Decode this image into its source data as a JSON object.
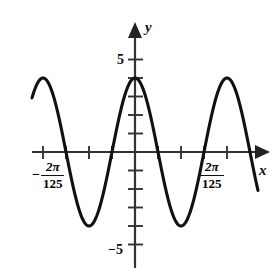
{
  "figure": {
    "name": "cosine-graph",
    "background_color": "#ffffff",
    "curve_color": "#111111",
    "axis_color": "#333333"
  },
  "axes": {
    "x_axis_label": "x",
    "y_axis_label": "y",
    "x_axis_name": "x-axis",
    "y_axis_name": "y-axis"
  },
  "ticks": {
    "y_labeled": [
      {
        "value": 5,
        "text": "5"
      },
      {
        "value": -5,
        "text": "−5"
      }
    ],
    "x_labeled_left": {
      "sign": "−",
      "numerator": "2π",
      "denominator": "125",
      "text": "−2π/125"
    },
    "x_labeled_right": {
      "sign": "",
      "numerator": "2π",
      "denominator": "125",
      "text": "2π/125"
    }
  },
  "chart_data": {
    "type": "line",
    "title": "",
    "xlabel": "x",
    "ylabel": "y",
    "grid": false,
    "legend": "none",
    "function": "y = 4 cos(125 x)",
    "amplitude": 4,
    "period": "2π/125",
    "xlim": [
      -0.0314159,
      0.0314159
    ],
    "ylim": [
      -6,
      6
    ],
    "x_tick_values": [
      -0.02513,
      -0.01885,
      -0.01257,
      -0.00628,
      0,
      0.00628,
      0.01257,
      0.01885,
      0.02513
    ],
    "y_tick_values": [
      5,
      4,
      3,
      2,
      1,
      -1,
      -2,
      -3,
      -4,
      -5
    ],
    "series": [
      {
        "name": "y = 4 cos(125 x)",
        "x": [
          -0.0314159,
          -0.0298451,
          -0.0282743,
          -0.0267035,
          -0.0251327,
          -0.0235619,
          -0.0219911,
          -0.0204204,
          -0.0188496,
          -0.0172788,
          -0.015708,
          -0.0141372,
          -0.0125664,
          -0.0109956,
          -0.0094248,
          -0.007854,
          -0.0062832,
          -0.0047124,
          -0.0031416,
          -0.0015708,
          0,
          0.0015708,
          0.0031416,
          0.0047124,
          0.0062832,
          0.007854,
          0.0094248,
          0.0109956,
          0.0125664,
          0.0141372,
          0.015708,
          0.0172788,
          0.0188496,
          0.0204204,
          0.0219911,
          0.0235619,
          0.0251327,
          0.0267035,
          0.0282743,
          0.0298451,
          0.0314159
        ],
        "y": [
          4,
          3.24,
          1.24,
          -1.24,
          -3.24,
          -4,
          -3.24,
          -1.24,
          1.24,
          3.24,
          4,
          3.24,
          1.24,
          -1.24,
          -3.24,
          -4,
          -3.24,
          -1.24,
          1.24,
          3.24,
          4,
          3.24,
          1.24,
          -1.24,
          -3.24,
          -4,
          -3.24,
          -1.24,
          1.24,
          3.24,
          4,
          3.24,
          1.24,
          -1.24,
          -3.24,
          -4,
          -3.24,
          -1.24,
          1.24,
          3.24,
          4
        ]
      }
    ],
    "annotations": [
      {
        "text": "5",
        "at": "y-axis"
      },
      {
        "text": "−5",
        "at": "y-axis"
      },
      {
        "text": "2π/125",
        "at": "x-axis-right"
      },
      {
        "text": "−2π/125",
        "at": "x-axis-left"
      }
    ]
  }
}
